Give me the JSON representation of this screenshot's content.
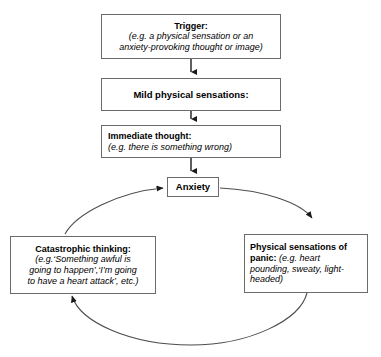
{
  "diagram": {
    "colors": {
      "box_border": "#6b6b6b",
      "arrow": "#1a1a1a",
      "cycle_line": "#4d4d4d",
      "background": "#ffffff",
      "text": "#000000"
    },
    "nodes": {
      "trigger": {
        "heading": "Trigger:",
        "example_line1": "(e.g. a physical sensation or an",
        "example_line2": "anxiety-provoking thought or image)"
      },
      "mild": {
        "heading": "Mild physical sensations:"
      },
      "immediate": {
        "heading": "Immediate thought:",
        "example": "(e.g. there is something wrong)"
      },
      "anxiety": {
        "heading": "Anxiety"
      },
      "catastrophic": {
        "heading": "Catastrophic thinking:",
        "example_line1": "(e.g.‘Something awful is",
        "example_line2": "going to happen’,‘I’m going",
        "example_line3": "to have a heart attack’, etc.)"
      },
      "physical_panic": {
        "heading_line1": "Physical sensations of",
        "heading_line2": "panic:",
        "example_line2": " (e.g. heart",
        "example_line3": "pounding, sweaty, light-",
        "example_line4": "headed)"
      }
    },
    "connectors": [
      {
        "name": "trigger-to-mild",
        "from": "trigger",
        "to": "mild",
        "style": "straight-arrow-down"
      },
      {
        "name": "mild-to-immediate",
        "from": "mild",
        "to": "immediate",
        "style": "straight-arrow-down"
      },
      {
        "name": "immediate-to-anxiety",
        "from": "immediate",
        "to": "anxiety",
        "style": "straight-arrow-down"
      },
      {
        "name": "anxiety-to-physical-panic",
        "from": "anxiety",
        "to": "physical_panic",
        "style": "curved-arrow-clockwise"
      },
      {
        "name": "physical-panic-to-catastrophic",
        "from": "physical_panic",
        "to": "catastrophic",
        "style": "curved-arrow-clockwise"
      },
      {
        "name": "catastrophic-to-anxiety",
        "from": "catastrophic",
        "to": "anxiety",
        "style": "curved-arrow-clockwise"
      }
    ]
  }
}
